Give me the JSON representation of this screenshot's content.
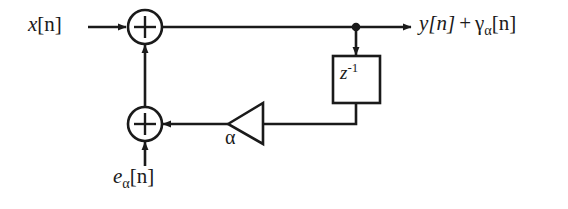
{
  "diagram": {
    "type": "signal-flow-block-diagram",
    "background_color": "#ffffff",
    "line_color": "#1a1a1a",
    "labels": {
      "input": "x[n]",
      "input_base": "x",
      "input_index": "[n]",
      "output": "y[n] + γα[n]",
      "output_first_term": "y[n]",
      "output_plus": "+",
      "output_second_base": "γ",
      "output_second_subscript": "α",
      "output_second_index": "[n]",
      "error_input_base": "e",
      "error_input_subscript": "α",
      "error_input_index": "[n]",
      "error_input": "eα[n]",
      "gain": "α",
      "delay_base": "z",
      "delay_exponent": "-1",
      "delay": "z⁻¹",
      "adder_symbol": "+"
    },
    "nodes": [
      {
        "name": "top-adder",
        "label": "+",
        "shape": "circle",
        "cx": 145,
        "cy": 27,
        "r": 17
      },
      {
        "name": "bottom-adder",
        "label": "+",
        "shape": "circle",
        "cx": 145,
        "cy": 124,
        "r": 17
      },
      {
        "name": "delay-block",
        "label": "z⁻¹",
        "shape": "rect",
        "x": 333,
        "y": 56,
        "w": 47,
        "h": 47
      },
      {
        "name": "gain-triangle",
        "label": "α",
        "shape": "triangle",
        "x": 228,
        "y": 103,
        "w": 35,
        "h": 41,
        "direction": "left"
      },
      {
        "name": "tap-junction",
        "shape": "dot",
        "cx": 356,
        "cy": 27,
        "r": 4
      }
    ],
    "edges": [
      {
        "name": "input-to-top-adder",
        "from": "x[n]",
        "to": "top-adder",
        "arrow": true
      },
      {
        "name": "top-adder-to-output",
        "from": "top-adder",
        "to": "y[n] + γα[n]",
        "arrow": true
      },
      {
        "name": "tap-to-delay",
        "from": "tap-junction",
        "to": "delay-block",
        "arrow": true
      },
      {
        "name": "delay-to-gain",
        "from": "delay-block",
        "to": "gain-triangle",
        "arrow": false
      },
      {
        "name": "gain-to-bottom-adder",
        "from": "gain-triangle",
        "to": "bottom-adder",
        "arrow": true
      },
      {
        "name": "bottom-adder-to-top-adder",
        "from": "bottom-adder",
        "to": "top-adder",
        "arrow": true
      },
      {
        "name": "error-input-to-bottom-adder",
        "from": "eα[n]",
        "to": "bottom-adder",
        "arrow": true
      }
    ]
  }
}
